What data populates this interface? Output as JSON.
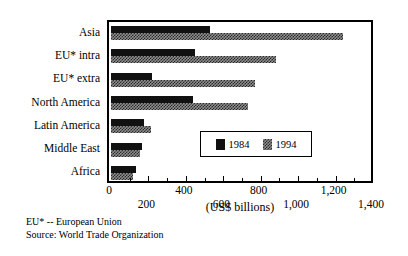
{
  "chart_data": {
    "type": "bar",
    "orientation": "horizontal",
    "title": "",
    "xlabel": "(US$ billions)",
    "ylabel": "",
    "categories": [
      "Asia",
      "EU* intra",
      "EU* extra",
      "North America",
      "Latin America",
      "Middle East",
      "Africa"
    ],
    "series": [
      {
        "name": "1984",
        "values": [
          530,
          450,
          220,
          440,
          175,
          165,
          135
        ]
      },
      {
        "name": "1994",
        "values": [
          1240,
          880,
          770,
          730,
          215,
          155,
          115
        ]
      }
    ],
    "xlim": [
      0,
      1400
    ],
    "xticks": [
      0,
      200,
      400,
      600,
      800,
      1000,
      1200,
      1400
    ],
    "xtick_labels": [
      "0",
      "200",
      "400",
      "600",
      "800",
      "1,000",
      "1,200",
      "1,400"
    ],
    "xtick_minor_interval": 100,
    "grid": false,
    "legend_position": "inside-center-right",
    "legend_entries": [
      "1984",
      "1994"
    ],
    "colors": {
      "series_1984": "#111111",
      "series_1994": "#8c8c8c",
      "axis": "#000000",
      "background": "#ffffff"
    }
  },
  "footnotes": [
    "EU* -- European Union",
    "Source: World Trade Organization"
  ]
}
